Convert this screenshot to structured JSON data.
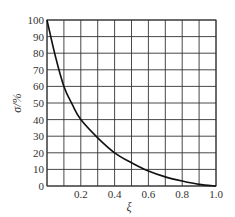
{
  "chart_data": {
    "type": "line",
    "title": "",
    "xlabel": "ξ",
    "ylabel": "σ/%",
    "xlim": [
      0,
      1.0
    ],
    "ylim": [
      0,
      100
    ],
    "grid": true,
    "legend": null,
    "x_ticks": [
      "0.2",
      "0.4",
      "0.6",
      "0.8",
      "1.0"
    ],
    "x_tick_values": [
      0.2,
      0.4,
      0.6,
      0.8,
      1.0
    ],
    "y_ticks": [
      "0",
      "10",
      "20",
      "30",
      "40",
      "50",
      "60",
      "70",
      "80",
      "90",
      "100"
    ],
    "y_tick_values": [
      0,
      10,
      20,
      30,
      40,
      50,
      60,
      70,
      80,
      90,
      100
    ],
    "x_grid": [
      0,
      0.1,
      0.2,
      0.3,
      0.4,
      0.5,
      0.6,
      0.7,
      0.8,
      0.9,
      1.0
    ],
    "y_grid": [
      0,
      10,
      20,
      30,
      40,
      50,
      60,
      70,
      80,
      90,
      100
    ],
    "series": [
      {
        "name": "σ(ξ)",
        "color": "#111111",
        "x": [
          0,
          0.05,
          0.1,
          0.15,
          0.2,
          0.3,
          0.4,
          0.5,
          0.6,
          0.7,
          0.8,
          0.9,
          1.0
        ],
        "y": [
          100,
          78,
          60,
          49,
          40,
          29,
          20,
          14,
          9,
          5.5,
          3,
          1,
          0
        ]
      }
    ]
  },
  "colors": {
    "grid": "#333333",
    "curve": "#111111",
    "background": "#ffffff"
  }
}
